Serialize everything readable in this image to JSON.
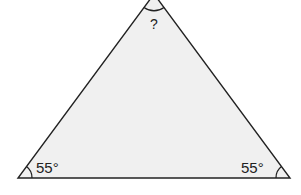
{
  "diagram": {
    "shape": "isosceles-triangle",
    "fill_color": "#f0f0f0",
    "stroke_color": "#222222",
    "vertices": {
      "apex": [
        154,
        -6
      ],
      "bottom_left": [
        18,
        178
      ],
      "bottom_right": [
        290,
        178
      ]
    },
    "angles": {
      "apex": "?",
      "bottom_left": "55°",
      "bottom_right": "55°"
    }
  }
}
